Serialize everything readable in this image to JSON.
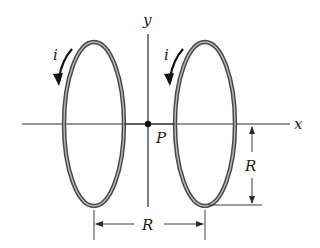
{
  "diagram": {
    "colors": {
      "background": "#ffffff",
      "line": "#2a2a2a",
      "loop": "#4a4a4a",
      "loop_highlight": "#b8b8b8"
    },
    "axes": {
      "x_label": "x",
      "y_label": "y"
    },
    "point": {
      "label": "P"
    },
    "loops": [
      {
        "id": "left",
        "current_label": "i",
        "direction": "downward-arrow"
      },
      {
        "id": "right",
        "current_label": "i",
        "direction": "downward-arrow"
      }
    ],
    "dimensions": {
      "radius_label": "R",
      "separation_label": "R"
    }
  }
}
